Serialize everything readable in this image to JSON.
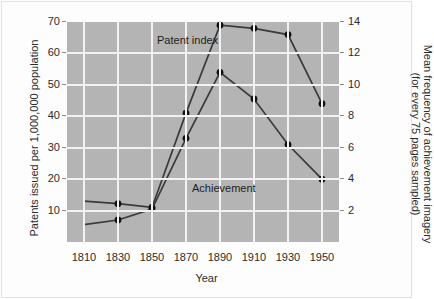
{
  "chart_data": {
    "type": "line",
    "title": "",
    "xlabel": "Year",
    "ylabel": "Patents issued per 1,000,000 population",
    "ylabel_right_line1": "Mean frequency of achievement imagery",
    "ylabel_right_line2": "(for every 75 pages sampled)",
    "x": [
      1810,
      1830,
      1850,
      1870,
      1890,
      1910,
      1930,
      1950
    ],
    "xlim": [
      1800,
      1960
    ],
    "xticks": [
      "1810",
      "1830",
      "1850",
      "1870",
      "1890",
      "1910",
      "1930",
      "1950"
    ],
    "ylim": [
      0,
      70
    ],
    "yticks": [
      "10",
      "20",
      "30",
      "40",
      "50",
      "60",
      "70"
    ],
    "ytickvalues": [
      10,
      20,
      30,
      40,
      50,
      60,
      70
    ],
    "ylim_right": [
      0,
      14
    ],
    "yticks_right": [
      "2",
      "4",
      "6",
      "8",
      "10",
      "12",
      "14"
    ],
    "ytickvalues_right": [
      2,
      4,
      6,
      8,
      10,
      12,
      14
    ],
    "grid": true,
    "legend_position": "inline-annotations",
    "plot_background": "#b4b4b4",
    "grid_color": "#f2f2f2",
    "line_color": "#3a3a3a",
    "marker_color": "#111111",
    "series": [
      {
        "name": "Patent index",
        "axis": "left",
        "annotation": "Patent index",
        "values": [
          13.0,
          12.2,
          11.0,
          41.0,
          69.0,
          68.0,
          66.0,
          44.0
        ],
        "markers": [
          false,
          true,
          true,
          true,
          true,
          true,
          true,
          true
        ]
      },
      {
        "name": "Achievement",
        "axis": "right",
        "annotation": "Achievement",
        "values_left_scale": [
          5.5,
          7.0,
          10.5,
          33.0,
          54.0,
          45.5,
          31.0,
          20.0
        ],
        "values": [
          1.1,
          1.4,
          2.1,
          6.6,
          10.8,
          9.1,
          6.2,
          4.0
        ],
        "markers": [
          false,
          true,
          true,
          true,
          true,
          true,
          true,
          true
        ]
      }
    ]
  }
}
